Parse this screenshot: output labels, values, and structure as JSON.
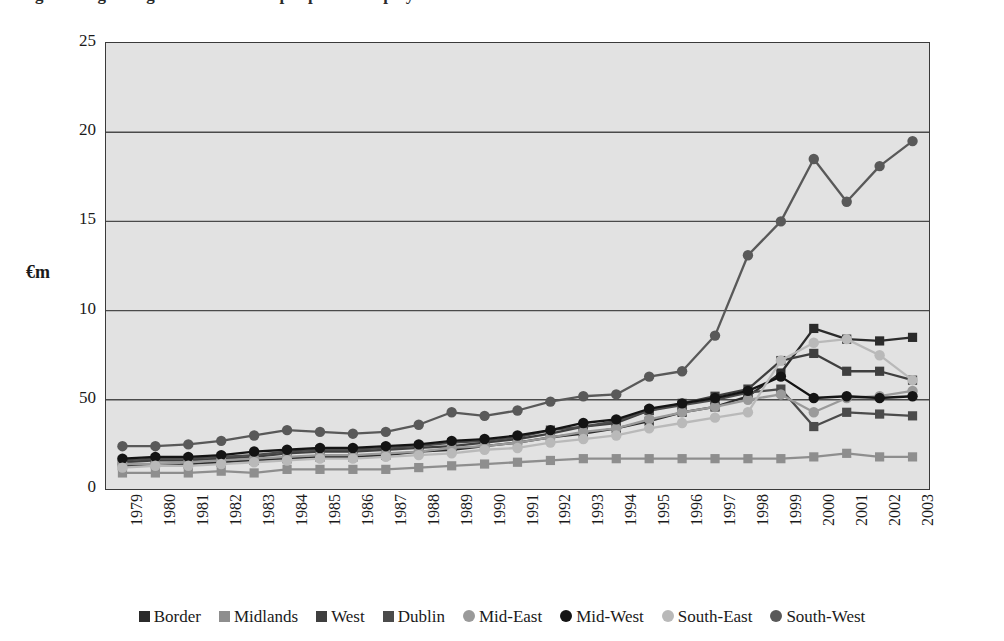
{
  "title": "Figure: Regional gross value added per person employed",
  "axis": {
    "ylabel": "€m",
    "yticks": [
      "25",
      "20",
      "15",
      "10",
      "50",
      "0"
    ],
    "ytick_values": [
      25,
      20,
      15,
      10,
      5,
      0
    ],
    "xticks": [
      "1979",
      "1980",
      "1981",
      "1982",
      "1983",
      "1984",
      "1985",
      "1986",
      "1987",
      "1988",
      "1989",
      "1990",
      "1991",
      "1992",
      "1993",
      "1994",
      "1995",
      "1996",
      "1997",
      "1998",
      "1999",
      "2000",
      "2001",
      "2002",
      "2003"
    ]
  },
  "colors": {
    "border": "#2b2b2b",
    "midlands": "#8e8e8e",
    "west": "#3f3f3f",
    "dublin": "#4b4b4b",
    "mid_east": "#9a9a9a",
    "mid_west": "#141414",
    "south_east": "#b9b9b9",
    "south_west": "#595959",
    "plot_background": "#e2e2e2",
    "grid": "#4a4a4a",
    "frame": "#3a3a3a"
  },
  "legend": {
    "position": "bottom",
    "items": [
      {
        "label": "Border",
        "marker": "square",
        "color": "#2b2b2b"
      },
      {
        "label": "Midlands",
        "marker": "square",
        "color": "#8e8e8e"
      },
      {
        "label": "West",
        "marker": "square",
        "color": "#3f3f3f"
      },
      {
        "label": "Dublin",
        "marker": "square",
        "color": "#4b4b4b"
      },
      {
        "label": "Mid-East",
        "marker": "circle",
        "color": "#9a9a9a"
      },
      {
        "label": "Mid-West",
        "marker": "circle",
        "color": "#141414"
      },
      {
        "label": "South-East",
        "marker": "circle",
        "color": "#b9b9b9"
      },
      {
        "label": "South-West",
        "marker": "circle",
        "color": "#595959"
      }
    ]
  },
  "chart_data": {
    "type": "line",
    "title": "Figure: Regional gross value added per person employed",
    "xlabel": "",
    "ylabel": "€m",
    "grid": true,
    "legend_position": "bottom",
    "xlim": [
      1979,
      2003
    ],
    "ylim": [
      0,
      25
    ],
    "categories": [
      "1979",
      "1980",
      "1981",
      "1982",
      "1983",
      "1984",
      "1985",
      "1986",
      "1987",
      "1988",
      "1989",
      "1990",
      "1991",
      "1992",
      "1993",
      "1994",
      "1995",
      "1996",
      "1997",
      "1998",
      "1999",
      "2000",
      "2001",
      "2002",
      "2003"
    ],
    "series": [
      {
        "name": "Border",
        "marker": "square",
        "color": "#2b2b2b",
        "values": [
          1.3,
          1.4,
          1.4,
          1.5,
          1.6,
          1.7,
          1.8,
          1.8,
          1.9,
          2.1,
          2.2,
          2.4,
          2.6,
          2.9,
          3.1,
          3.4,
          3.8,
          4.3,
          4.6,
          5.2,
          6.5,
          9.0,
          8.4,
          8.3,
          8.5
        ]
      },
      {
        "name": "Midlands",
        "marker": "square",
        "color": "#8e8e8e",
        "values": [
          0.9,
          0.9,
          0.9,
          1.0,
          0.9,
          1.1,
          1.1,
          1.1,
          1.1,
          1.2,
          1.3,
          1.4,
          1.5,
          1.6,
          1.7,
          1.7,
          1.7,
          1.7,
          1.7,
          1.7,
          1.7,
          1.8,
          2.0,
          1.8,
          1.8
        ]
      },
      {
        "name": "West",
        "marker": "square",
        "color": "#3f3f3f",
        "values": [
          1.5,
          1.6,
          1.6,
          1.7,
          1.8,
          2.0,
          2.1,
          2.1,
          2.2,
          2.3,
          2.4,
          2.6,
          2.8,
          3.1,
          3.5,
          3.7,
          4.4,
          4.8,
          5.2,
          5.6,
          7.2,
          7.6,
          6.6,
          6.6,
          6.1
        ]
      },
      {
        "name": "Dublin",
        "marker": "square",
        "color": "#4b4b4b",
        "values": [
          1.6,
          1.7,
          1.7,
          1.8,
          1.9,
          2.1,
          2.2,
          2.2,
          2.3,
          2.4,
          2.6,
          2.7,
          2.9,
          3.3,
          3.5,
          3.8,
          4.4,
          4.7,
          5.0,
          5.4,
          5.6,
          3.5,
          4.3,
          4.2,
          4.1
        ]
      },
      {
        "name": "Mid-East",
        "marker": "circle",
        "color": "#9a9a9a",
        "values": [
          1.4,
          1.4,
          1.5,
          1.6,
          1.7,
          1.8,
          1.9,
          1.9,
          2.0,
          2.1,
          2.3,
          2.4,
          2.6,
          2.9,
          3.2,
          3.4,
          3.9,
          4.3,
          4.6,
          5.0,
          5.3,
          4.3,
          5.1,
          5.2,
          5.5
        ]
      },
      {
        "name": "Mid-West",
        "marker": "circle",
        "color": "#141414",
        "values": [
          1.7,
          1.8,
          1.8,
          1.9,
          2.1,
          2.2,
          2.3,
          2.3,
          2.4,
          2.5,
          2.7,
          2.8,
          3.0,
          3.3,
          3.7,
          3.9,
          4.5,
          4.8,
          5.1,
          5.5,
          6.3,
          5.1,
          5.2,
          5.1,
          5.2
        ]
      },
      {
        "name": "South-East",
        "marker": "circle",
        "color": "#b9b9b9",
        "values": [
          1.2,
          1.3,
          1.3,
          1.4,
          1.5,
          1.6,
          1.7,
          1.7,
          1.8,
          1.9,
          2.0,
          2.2,
          2.3,
          2.6,
          2.8,
          3.0,
          3.4,
          3.7,
          4.0,
          4.3,
          7.2,
          8.2,
          8.4,
          7.5,
          6.1
        ]
      },
      {
        "name": "South-West",
        "marker": "circle",
        "color": "#595959",
        "values": [
          2.4,
          2.4,
          2.5,
          2.7,
          3.0,
          3.3,
          3.2,
          3.1,
          3.2,
          3.6,
          4.3,
          4.1,
          4.4,
          4.9,
          5.2,
          5.3,
          6.3,
          6.6,
          8.6,
          13.1,
          15.0,
          18.5,
          16.1,
          18.1,
          19.5
        ]
      }
    ]
  }
}
